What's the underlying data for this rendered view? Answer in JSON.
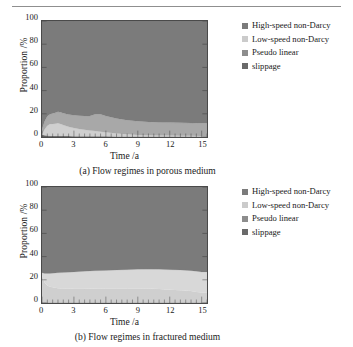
{
  "figure": {
    "top_rule": true,
    "panels": [
      {
        "id": "a",
        "caption": "(a) Flow regimes in porous medium",
        "chart_data": {
          "type": "area",
          "stacked": true,
          "title": "(a) Flow regimes in porous medium",
          "xlabel": "Time /a",
          "ylabel": "Proportion /%",
          "xlim": [
            0,
            15.5
          ],
          "ylim": [
            0,
            100
          ],
          "xticks": [
            0,
            3,
            6,
            9,
            12,
            15
          ],
          "yticks": [
            0,
            20,
            40,
            60,
            80,
            100
          ],
          "grid": false,
          "legend_position": "right",
          "x": [
            0,
            0.25,
            0.5,
            0.75,
            1,
            1.25,
            1.5,
            1.75,
            2,
            2.5,
            3,
            3.5,
            4,
            4.5,
            5,
            5.5,
            6,
            7,
            8,
            9,
            10,
            11,
            12,
            13,
            14,
            15,
            15.5
          ],
          "series": [
            {
              "name": "slippage",
              "color": "#6f6f6f",
              "values": [
                2.0,
                1.6,
                1.3,
                1.1,
                1.0,
                0.9,
                0.9,
                0.8,
                0.8,
                0.8,
                0.7,
                0.7,
                0.7,
                0.6,
                0.6,
                0.6,
                0.6,
                0.5,
                0.5,
                0.5,
                0.5,
                0.5,
                0.5,
                0.5,
                0.5,
                0.5,
                0.5
              ]
            },
            {
              "name": "Pseudo linear",
              "color": "#cfcfcf",
              "values": [
                0.0,
                5.0,
                8.5,
                10.0,
                10.3,
                10.5,
                11.0,
                10.5,
                9.5,
                8.0,
                7.0,
                6.2,
                5.5,
                5.0,
                4.5,
                4.0,
                3.5,
                2.5,
                1.8,
                1.3,
                1.0,
                0.8,
                0.7,
                0.6,
                0.5,
                0.4,
                0.4
              ]
            },
            {
              "name": "Low-speed non-Darcy",
              "color": "#a8a8a8",
              "values": [
                5.0,
                7.0,
                8.0,
                8.5,
                9.0,
                9.5,
                9.8,
                10.0,
                10.2,
                10.5,
                11.0,
                11.5,
                12.0,
                12.5,
                14.5,
                15.0,
                14.0,
                13.0,
                12.2,
                11.8,
                11.5,
                11.3,
                11.2,
                11.1,
                11.0,
                11.0,
                11.0
              ]
            },
            {
              "name": "High-speed non-Darcy",
              "color": "#7b7b7b",
              "values": [
                93.0,
                86.4,
                82.2,
                80.4,
                79.7,
                79.1,
                78.3,
                78.7,
                79.5,
                80.7,
                81.3,
                81.6,
                81.8,
                81.9,
                80.4,
                80.4,
                81.9,
                84.0,
                85.5,
                86.4,
                87.0,
                87.4,
                87.6,
                87.8,
                88.0,
                88.1,
                88.1
              ]
            }
          ],
          "legend": [
            "High-speed non-Darcy",
            "Low-speed non-Darcy",
            "Pseudo linear",
            "slippage"
          ]
        }
      },
      {
        "id": "b",
        "caption": "(b) Flow regimes in fractured medium",
        "chart_data": {
          "type": "area",
          "stacked": true,
          "title": "(b) Flow regimes in fractured medium",
          "xlabel": "Time /a",
          "ylabel": "Proportion /%",
          "xlim": [
            0,
            15.5
          ],
          "ylim": [
            0,
            100
          ],
          "xticks": [
            0,
            3,
            6,
            9,
            12,
            15
          ],
          "yticks": [
            0,
            20,
            40,
            60,
            80,
            100
          ],
          "grid": false,
          "legend_position": "right",
          "x": [
            0,
            0.25,
            0.5,
            0.75,
            1,
            1.5,
            2,
            3,
            4,
            5,
            6,
            7,
            8,
            9,
            10,
            11,
            12,
            13,
            14,
            14.5,
            15,
            15.5
          ],
          "series": [
            {
              "name": "slippage",
              "color": "#6f6f6f",
              "values": [
                0.5,
                0.5,
                0.5,
                0.5,
                0.5,
                0.5,
                0.5,
                0.5,
                0.5,
                0.5,
                0.5,
                0.5,
                0.5,
                0.5,
                0.5,
                0.5,
                0.5,
                0.5,
                0.5,
                0.5,
                0.5,
                0.5
              ]
            },
            {
              "name": "Pseudo linear",
              "color": "#cfcfcf",
              "values": [
                23.5,
                17.0,
                14.5,
                13.5,
                13.0,
                12.3,
                12.0,
                11.8,
                11.8,
                11.9,
                12.0,
                12.0,
                12.0,
                12.0,
                11.9,
                11.5,
                11.0,
                10.5,
                9.8,
                9.0,
                8.5,
                8.5
              ]
            },
            {
              "name": "Low-speed non-Darcy",
              "color": "#d8d8d8",
              "values": [
                2.0,
                8.0,
                10.5,
                11.5,
                12.2,
                13.2,
                13.8,
                14.5,
                15.0,
                15.4,
                15.6,
                15.9,
                16.2,
                16.5,
                16.8,
                17.0,
                17.2,
                17.4,
                17.6,
                17.8,
                17.8,
                17.8
              ]
            },
            {
              "name": "High-speed non-Darcy",
              "color": "#7b7b7b",
              "values": [
                74.0,
                74.5,
                74.5,
                74.5,
                74.3,
                74.0,
                73.7,
                73.2,
                72.7,
                72.2,
                71.9,
                71.6,
                71.3,
                71.0,
                70.8,
                71.0,
                71.3,
                71.6,
                72.1,
                72.7,
                73.2,
                73.2
              ]
            }
          ],
          "legend": [
            "High-speed non-Darcy",
            "Low-speed non-Darcy",
            "Pseudo linear",
            "slippage"
          ]
        }
      }
    ],
    "legend_entries": [
      {
        "label": "High-speed non-Darcy",
        "color": "#7b7b7b"
      },
      {
        "label": "Low-speed non-Darcy",
        "color": "#cbcbcb"
      },
      {
        "label": "Pseudo linear",
        "color": "#8d8d8d"
      },
      {
        "label": "slippage",
        "color": "#6a6a6a"
      }
    ],
    "axis": {
      "xlabel": "Time /a",
      "ylabel": "Proportion /%",
      "xticks": [
        "0",
        "3",
        "6",
        "9",
        "12",
        "15"
      ],
      "yticks": [
        "100",
        "80",
        "60",
        "40",
        "20",
        "0"
      ]
    }
  }
}
